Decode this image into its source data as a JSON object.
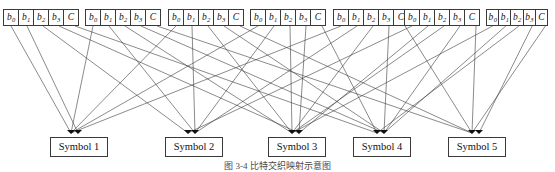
{
  "figure": {
    "type": "interleaver-mapping-diagram",
    "caption": "图 3-4  比特交织映射示意图",
    "width": 555,
    "height": 172,
    "line_color": "#3c3c3c",
    "box_border_color": "#3a3a3a",
    "background": "#ffffff"
  },
  "top_groups": {
    "count": 7,
    "cell_labels": [
      "b0",
      "b1",
      "b2",
      "b3",
      "C"
    ],
    "cells_display": [
      {
        "base": "b",
        "sub": "0"
      },
      {
        "base": "b",
        "sub": "1"
      },
      {
        "base": "b",
        "sub": "2"
      },
      {
        "base": "b",
        "sub": "3"
      },
      {
        "base": "C",
        "sub": ""
      }
    ],
    "groups": [
      {
        "index": 1,
        "x": 3,
        "width": 79,
        "cell_width": 16
      },
      {
        "index": 2,
        "x": 85,
        "width": 79,
        "cell_width": 16
      },
      {
        "index": 3,
        "x": 168,
        "width": 79,
        "cell_width": 16
      },
      {
        "index": 4,
        "x": 250,
        "width": 79,
        "cell_width": 16
      },
      {
        "index": 5,
        "x": 333,
        "width": 79,
        "cell_width": 16
      },
      {
        "index": 6,
        "x": 404,
        "width": 79,
        "cell_width": 16
      },
      {
        "index": 7,
        "x": 486,
        "width": 66,
        "cell_width": 13.2
      }
    ]
  },
  "symbols": {
    "count": 5,
    "boxes": [
      {
        "label": "Symbol 1",
        "x": 50,
        "y": 137,
        "width": 58,
        "node_x": 75,
        "node_y": 133
      },
      {
        "label": "Symbol 2",
        "x": 165,
        "y": 137,
        "width": 58,
        "node_x": 192,
        "node_y": 133
      },
      {
        "label": "Symbol 3",
        "x": 268,
        "y": 137,
        "width": 58,
        "node_x": 296,
        "node_y": 133
      },
      {
        "label": "Symbol 4",
        "x": 353,
        "y": 137,
        "width": 58,
        "node_x": 381,
        "node_y": 133
      },
      {
        "label": "Symbol 5",
        "x": 448,
        "y": 137,
        "width": 58,
        "node_x": 476,
        "node_y": 133
      }
    ]
  },
  "edges": {
    "description": "Each top cell bottom connects down to one symbol node; bit-interleaved mapping.",
    "source_y": 26,
    "mapping": [
      {
        "group": 1,
        "cell": 0,
        "symbol": 1
      },
      {
        "group": 1,
        "cell": 1,
        "symbol": 1
      },
      {
        "group": 1,
        "cell": 2,
        "symbol": 2
      },
      {
        "group": 1,
        "cell": 3,
        "symbol": 3
      },
      {
        "group": 1,
        "cell": 4,
        "symbol": 4
      },
      {
        "group": 2,
        "cell": 0,
        "symbol": 1
      },
      {
        "group": 2,
        "cell": 1,
        "symbol": 2
      },
      {
        "group": 2,
        "cell": 2,
        "symbol": 3
      },
      {
        "group": 2,
        "cell": 3,
        "symbol": 4
      },
      {
        "group": 2,
        "cell": 4,
        "symbol": 5
      },
      {
        "group": 3,
        "cell": 0,
        "symbol": 1
      },
      {
        "group": 3,
        "cell": 1,
        "symbol": 2
      },
      {
        "group": 3,
        "cell": 2,
        "symbol": 3
      },
      {
        "group": 3,
        "cell": 3,
        "symbol": 4
      },
      {
        "group": 3,
        "cell": 4,
        "symbol": 5
      },
      {
        "group": 4,
        "cell": 0,
        "symbol": 1
      },
      {
        "group": 4,
        "cell": 1,
        "symbol": 2
      },
      {
        "group": 4,
        "cell": 2,
        "symbol": 3
      },
      {
        "group": 4,
        "cell": 3,
        "symbol": 3
      },
      {
        "group": 4,
        "cell": 4,
        "symbol": 4
      },
      {
        "group": 5,
        "cell": 0,
        "symbol": 1
      },
      {
        "group": 5,
        "cell": 1,
        "symbol": 2
      },
      {
        "group": 5,
        "cell": 2,
        "symbol": 3
      },
      {
        "group": 5,
        "cell": 3,
        "symbol": 4
      },
      {
        "group": 5,
        "cell": 4,
        "symbol": 5
      },
      {
        "group": 6,
        "cell": 0,
        "symbol": 2
      },
      {
        "group": 6,
        "cell": 1,
        "symbol": 3
      },
      {
        "group": 6,
        "cell": 2,
        "symbol": 3
      },
      {
        "group": 6,
        "cell": 3,
        "symbol": 4
      },
      {
        "group": 6,
        "cell": 4,
        "symbol": 5
      },
      {
        "group": 7,
        "cell": 0,
        "symbol": 3
      },
      {
        "group": 7,
        "cell": 1,
        "symbol": 4
      },
      {
        "group": 7,
        "cell": 2,
        "symbol": 4
      },
      {
        "group": 7,
        "cell": 3,
        "symbol": 5
      },
      {
        "group": 7,
        "cell": 4,
        "symbol": 5
      }
    ]
  }
}
